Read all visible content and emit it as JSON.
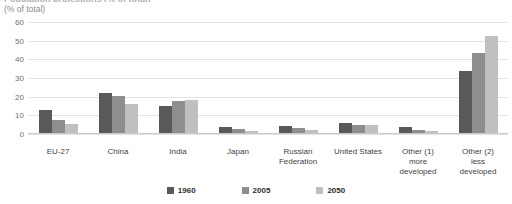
{
  "header": {
    "title_clipped": "Population projections (% of total)",
    "subtitle": "(% of total)"
  },
  "chart_data": {
    "type": "bar",
    "title": "",
    "subtitle": "(% of total)",
    "xlabel": "",
    "ylabel": "(% of total)",
    "ylim": [
      0,
      60
    ],
    "yticks": [
      60,
      50,
      40,
      30,
      20,
      10,
      0
    ],
    "grid": true,
    "legend_position": "bottom",
    "categories": [
      "EU-27",
      "China",
      "India",
      "Japan",
      "Russian Federation",
      "United States",
      "Other (1) more developed",
      "Other (2) less developed"
    ],
    "category_lines": [
      [
        "EU-27"
      ],
      [
        "China"
      ],
      [
        "India"
      ],
      [
        "Japan"
      ],
      [
        "Russian",
        "Federation"
      ],
      [
        "United States"
      ],
      [
        "Other (1)",
        "more",
        "developed"
      ],
      [
        "Other (2)",
        "less",
        "developed"
      ]
    ],
    "series": [
      {
        "name": "1960",
        "color": "#595959",
        "values": [
          12.5,
          21.5,
          14.5,
          3.0,
          4.0,
          5.5,
          3.0,
          33.0
        ]
      },
      {
        "name": "2005",
        "color": "#8e8e8e",
        "values": [
          7.0,
          20.0,
          17.0,
          2.0,
          2.5,
          4.5,
          1.5,
          43.0
        ]
      },
      {
        "name": "2050",
        "color": "#c0c0c0",
        "values": [
          5.0,
          15.5,
          17.5,
          1.0,
          1.5,
          4.5,
          1.0,
          52.0
        ]
      }
    ]
  },
  "colors": {
    "series_1960": "#595959",
    "series_2005": "#8e8e8e",
    "series_2050": "#c0c0c0",
    "gridline": "#e3e3e3",
    "axis_text": "#6f6f6f",
    "background": "#ffffff"
  }
}
